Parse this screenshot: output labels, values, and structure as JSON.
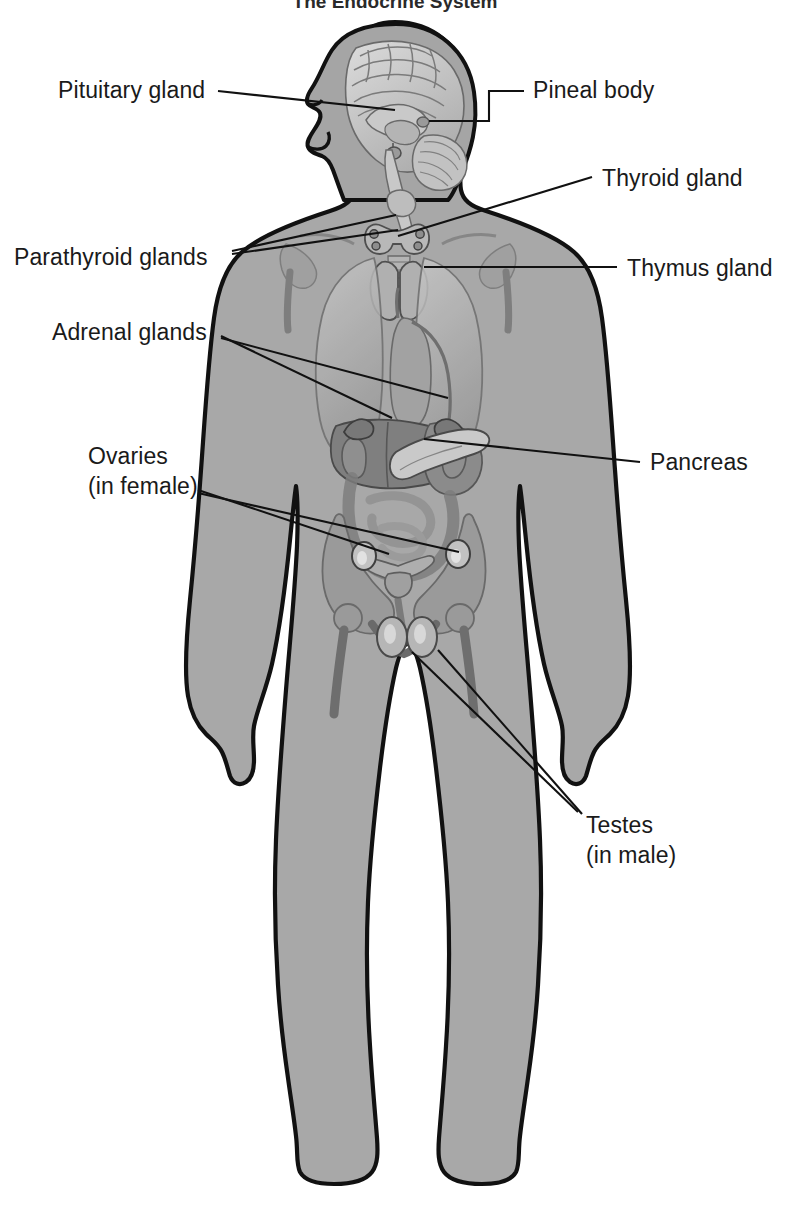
{
  "figure": {
    "title": "The Endocrine System",
    "title_visible_partially": true,
    "view": "anterior body silhouette with sagittal head section",
    "colors": {
      "body_fill": "#a8a8a8",
      "body_outline": "#111111",
      "organ_light": "#c4c4c4",
      "organ_mid": "#9a9a9a",
      "organ_dark": "#7a7a7a",
      "organ_darkest": "#5f5f5f",
      "leader_line": "#111111",
      "label_text": "#1a1a1a",
      "background": "#ffffff"
    }
  },
  "labels": [
    {
      "id": "pituitary-gland",
      "text": "Pituitary gland",
      "lines": [
        "Pituitary gland"
      ],
      "side": "left",
      "text_x": 58,
      "text_y": 98,
      "anchor": "start",
      "leaders": [
        {
          "points": "218,91 395,110"
        }
      ]
    },
    {
      "id": "pineal-body",
      "text": "Pineal body",
      "lines": [
        "Pineal body"
      ],
      "side": "right",
      "text_x": 533,
      "text_y": 98,
      "anchor": "start",
      "leaders": [
        {
          "points": "429,121 489,121 489,91 524,91"
        }
      ]
    },
    {
      "id": "thyroid-gland",
      "text": "Thyroid gland",
      "lines": [
        "Thyroid gland"
      ],
      "side": "right",
      "text_x": 602,
      "text_y": 186,
      "anchor": "start",
      "leaders": [
        {
          "points": "398,236 592,177"
        }
      ]
    },
    {
      "id": "parathyroid-glands",
      "text": "Parathyroid glands",
      "lines": [
        "Parathyroid glands"
      ],
      "side": "left",
      "text_x": 14,
      "text_y": 265,
      "anchor": "start",
      "leaders": [
        {
          "points": "232,251 396,215"
        },
        {
          "points": "232,254 398,230"
        }
      ]
    },
    {
      "id": "thymus-gland",
      "text": "Thymus gland",
      "lines": [
        "Thymus gland"
      ],
      "side": "right",
      "text_x": 627,
      "text_y": 276,
      "anchor": "start",
      "leaders": [
        {
          "points": "424,267 617,267"
        }
      ]
    },
    {
      "id": "adrenal-glands",
      "text": "Adrenal glands",
      "lines": [
        "Adrenal glands"
      ],
      "side": "left",
      "text_x": 52,
      "text_y": 340,
      "anchor": "start",
      "leaders": [
        {
          "points": "221,336 392,418"
        },
        {
          "points": "221,338 448,398"
        }
      ]
    },
    {
      "id": "pancreas",
      "text": "Pancreas",
      "lines": [
        "Pancreas"
      ],
      "side": "right",
      "text_x": 650,
      "text_y": 470,
      "anchor": "start",
      "leaders": [
        {
          "points": "424,439 640,462"
        }
      ]
    },
    {
      "id": "ovaries-in-female",
      "text": "Ovaries (in female)",
      "lines": [
        "Ovaries",
        "(in female)"
      ],
      "side": "left",
      "text_x": 88,
      "text_y": 464,
      "second_line_y": 494,
      "anchor": "start",
      "leaders": [
        {
          "points": "198,490 389,554"
        },
        {
          "points": "198,493 459,552"
        }
      ]
    },
    {
      "id": "testes-in-male",
      "text": "Testes (in male)",
      "lines": [
        "Testes",
        "(in male)"
      ],
      "side": "right",
      "text_x": 586,
      "text_y": 833,
      "second_line_y": 863,
      "anchor": "start",
      "leaders": [
        {
          "points": "412,652 578,812"
        },
        {
          "points": "438,650 582,814"
        }
      ]
    }
  ],
  "organs": [
    {
      "name": "brain",
      "region": "head",
      "note": "mid-sagittal section showing cerebrum, corpus callosum, cerebellum, brainstem"
    },
    {
      "name": "pituitary-gland",
      "region": "head"
    },
    {
      "name": "pineal-body",
      "region": "head"
    },
    {
      "name": "thyroid-gland",
      "region": "neck"
    },
    {
      "name": "parathyroid-glands",
      "region": "neck"
    },
    {
      "name": "larynx-trachea",
      "region": "neck"
    },
    {
      "name": "thymus-gland",
      "region": "chest"
    },
    {
      "name": "lungs",
      "region": "chest"
    },
    {
      "name": "heart-vessels",
      "region": "chest"
    },
    {
      "name": "liver",
      "region": "abdomen"
    },
    {
      "name": "stomach",
      "region": "abdomen"
    },
    {
      "name": "adrenal-glands",
      "region": "abdomen"
    },
    {
      "name": "kidneys",
      "region": "abdomen"
    },
    {
      "name": "pancreas",
      "region": "abdomen"
    },
    {
      "name": "intestines",
      "region": "abdomen"
    },
    {
      "name": "pelvis",
      "region": "pelvis"
    },
    {
      "name": "uterus",
      "region": "pelvis"
    },
    {
      "name": "ovaries",
      "region": "pelvis"
    },
    {
      "name": "testes",
      "region": "pelvis"
    },
    {
      "name": "clavicle-scapula",
      "region": "shoulders"
    },
    {
      "name": "femur",
      "region": "pelvis"
    }
  ]
}
